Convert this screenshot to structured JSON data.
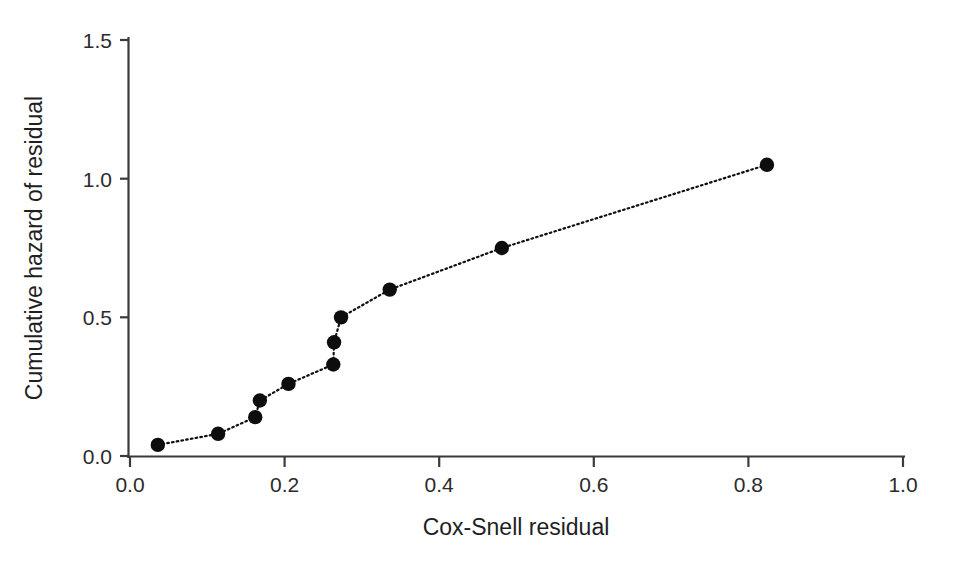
{
  "chart_data": {
    "type": "scatter",
    "title": "",
    "subtitle": "",
    "xlabel": "Cox-Snell residual",
    "ylabel": "Cumulative hazard of residual",
    "xlim": [
      0.0,
      1.0
    ],
    "ylim": [
      0.0,
      1.5
    ],
    "xticks": [
      "0.0",
      "0.2",
      "0.4",
      "0.6",
      "0.8",
      "1.0"
    ],
    "xtick_values": [
      0.0,
      0.2,
      0.4,
      0.6,
      0.8,
      1.0
    ],
    "yticks": [
      "0.0",
      "0.5",
      "1.0",
      "1.5"
    ],
    "ytick_values": [
      0.0,
      0.5,
      1.0,
      1.5
    ],
    "grid": false,
    "legend": null,
    "legend_position": "none",
    "marker": "filled-circle",
    "line_style": "dotted",
    "series": [
      {
        "name": "Cumulative hazard of Cox-Snell residual",
        "color": "#0d0d0d",
        "x": [
          0.036,
          0.114,
          0.162,
          0.168,
          0.205,
          0.263,
          0.264,
          0.273,
          0.336,
          0.481,
          0.824
        ],
        "y": [
          0.04,
          0.08,
          0.14,
          0.2,
          0.26,
          0.33,
          0.41,
          0.5,
          0.6,
          0.75,
          1.05
        ]
      }
    ]
  },
  "axes": {
    "x_axis_name": "Cox-Snell residual",
    "y_axis_name": "Cumulative hazard of residual"
  }
}
